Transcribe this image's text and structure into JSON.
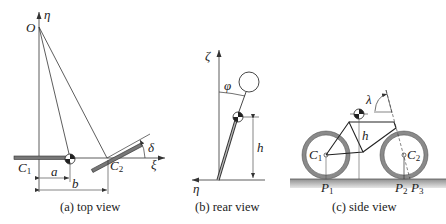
{
  "figure": {
    "panels": [
      {
        "id": "top-view",
        "caption": "(a) top view",
        "labels": {
          "origin": "O",
          "eta_axis": "η",
          "xi_axis": "ξ",
          "rear_contact": "C",
          "rear_contact_sub": "1",
          "front_contact": "C",
          "front_contact_sub": "2",
          "dim_a": "a",
          "dim_b": "b",
          "steer_angle": "δ"
        }
      },
      {
        "id": "rear-view",
        "caption": "(b) rear view",
        "labels": {
          "zeta_axis": "ζ",
          "eta_axis": "η",
          "lean_angle": "φ",
          "height": "h"
        }
      },
      {
        "id": "side-view",
        "caption": "(c) side view",
        "labels": {
          "rear_hub": "C",
          "rear_hub_sub": "1",
          "front_hub": "C",
          "front_hub_sub": "2",
          "rear_contact": "P",
          "rear_contact_sub": "1",
          "front_contact": "P",
          "front_contact_sub": "2",
          "trail_point": "P",
          "trail_point_sub": "3",
          "height": "h",
          "head_angle": "λ"
        }
      }
    ],
    "colors": {
      "line": "#333333",
      "tire": "#8a8a8a",
      "ground": "#9a9a9a"
    }
  }
}
